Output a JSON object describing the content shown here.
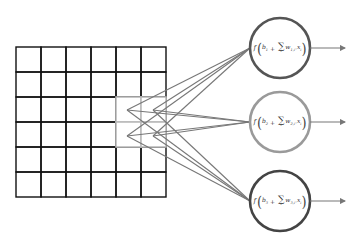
{
  "diagram": {
    "grid": {
      "rows": 6,
      "cols": 6,
      "x": 16,
      "y": 47,
      "cell_size": 25,
      "line_color": "#111111",
      "highlight": {
        "row_start": 2,
        "col_start": 4,
        "rows": 2,
        "cols": 2,
        "color": "#bbbbbb"
      }
    },
    "apex_points": [
      {
        "x": 127,
        "y": 110
      },
      {
        "x": 127,
        "y": 136
      },
      {
        "x": 153,
        "y": 110
      },
      {
        "x": 153,
        "y": 136
      }
    ],
    "connection_color": "#777777",
    "neurons": [
      {
        "cx": 280,
        "cy": 48,
        "r": 30,
        "stroke": "#555555",
        "formula": {
          "f": "f",
          "bias": "b",
          "bias_sub": "1",
          "sum": "∑",
          "sum_index": "i",
          "weight": "w",
          "weight_sub": "1,i",
          "op": "·",
          "x": "x",
          "x_sub": "i"
        },
        "arrow_to_x": 345
      },
      {
        "cx": 280,
        "cy": 122,
        "r": 30,
        "stroke": "#9a9a9a",
        "formula": {
          "f": "f",
          "bias": "b",
          "bias_sub": "2",
          "sum": "∑",
          "sum_index": "i",
          "weight": "w",
          "weight_sub": "2,i",
          "op": "·",
          "x": "x",
          "x_sub": "i"
        },
        "arrow_to_x": 345
      },
      {
        "cx": 280,
        "cy": 201,
        "r": 30,
        "stroke": "#444444",
        "formula": {
          "f": "f",
          "bias": "b",
          "bias_sub": "3",
          "sum": "∑",
          "sum_index": "i",
          "weight": "w",
          "weight_sub": "3,i",
          "op": "·",
          "x": "x",
          "x_sub": "i"
        },
        "arrow_to_x": 345
      }
    ]
  }
}
